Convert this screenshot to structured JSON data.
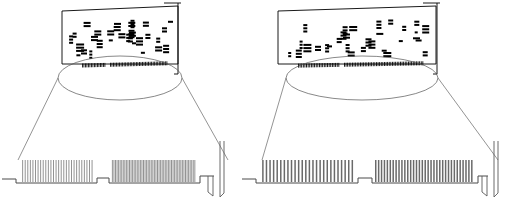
{
  "diagram": {
    "type": "technical-line-drawing",
    "variant_count": 2,
    "stroke_color": "#000000",
    "detail_stroke_color": "#5a5a5a",
    "component_color": "#000000",
    "background_color": "#ffffff"
  },
  "cards": [
    {
      "id": "left-card",
      "name": "left-expansion-card",
      "board": {
        "x": 62,
        "y": 9,
        "width": 116,
        "height": 58,
        "skew_top_right_y": 6,
        "skew_bottom_left_y": 62
      },
      "bracket": {
        "x": 178,
        "top_tab_width": 14,
        "height": 68
      },
      "inline_connector": {
        "segments": [
          {
            "start_x": 82,
            "end_x": 106,
            "pins": 16
          },
          {
            "start_x": 110,
            "end_x": 168,
            "pins": 38
          }
        ],
        "y": 64,
        "height": 4
      },
      "chip_count": 31,
      "magnifier": {
        "ellipse_cx": 120,
        "ellipse_cy": 78,
        "rx": 62,
        "ry": 22,
        "callout_left": [
          58,
          78,
          18,
          160
        ],
        "callout_right": [
          182,
          78,
          228,
          160
        ]
      },
      "magnified": {
        "edge_y": 183,
        "start_x": 18,
        "end_x": 222,
        "finger_style": "fine",
        "finger_count_left": 28,
        "finger_count_right": 54,
        "notch_x": 97,
        "notch_width": 12,
        "finger_height": 22,
        "bracket_x": 218
      }
    },
    {
      "id": "right-card",
      "name": "right-expansion-card",
      "board": {
        "x": 278,
        "y": 9,
        "width": 158,
        "height": 58,
        "skew_top_right_y": 6,
        "skew_bottom_left_y": 62
      },
      "bracket": {
        "x": 437,
        "top_tab_width": 14,
        "height": 68
      },
      "inline_connector": {
        "segments": [
          {
            "start_x": 298,
            "end_x": 340,
            "pins": 26
          },
          {
            "start_x": 344,
            "end_x": 424,
            "pins": 50
          }
        ],
        "y": 64,
        "height": 4
      },
      "chip_count": 31,
      "magnifier": {
        "ellipse_cx": 362,
        "ellipse_cy": 78,
        "rx": 76,
        "ry": 22,
        "callout_left": [
          286,
          78,
          262,
          160
        ],
        "callout_right": [
          438,
          78,
          498,
          160
        ]
      },
      "magnified": {
        "edge_y": 183,
        "start_x": 258,
        "end_x": 500,
        "finger_style": "wide",
        "finger_count_left": 26,
        "finger_count_right": 34,
        "notch_x": 358,
        "notch_width": 14,
        "finger_height": 22,
        "bracket_x": 492
      }
    }
  ],
  "labels": {
    "left_card_caption": "",
    "right_card_caption": ""
  }
}
